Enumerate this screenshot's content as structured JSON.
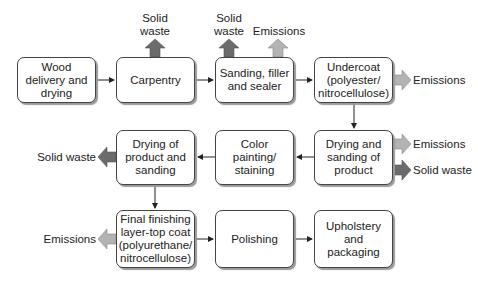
{
  "diagram": {
    "type": "process-flowchart",
    "colors": {
      "solid_waste_arrow": "#6b6b6b",
      "emissions_arrow": "#b3b3b3",
      "box_border": "#444444",
      "connector": "#222222"
    },
    "steps": [
      {
        "id": "s1",
        "label": "Wood\ndelivery and\ndrying"
      },
      {
        "id": "s2",
        "label": "Carpentry"
      },
      {
        "id": "s3",
        "label": "Sanding, filler\nand sealer"
      },
      {
        "id": "s4",
        "label": "Undercoat\n(polyester/\nnitrocellulose)"
      },
      {
        "id": "s5",
        "label": "Drying and\nsanding of\nproduct"
      },
      {
        "id": "s6",
        "label": "Color\npainting/\nstaining"
      },
      {
        "id": "s7",
        "label": "Drying of\nproduct and\nsanding"
      },
      {
        "id": "s8",
        "label": "Final finishing\nlayer-top coat\n(polyurethane/\nnitrocellulose)"
      },
      {
        "id": "s9",
        "label": "Polishing"
      },
      {
        "id": "s10",
        "label": "Upholstery and\npackaging"
      }
    ],
    "outputs": [
      {
        "from": "s2",
        "label": "Solid\nwaste",
        "kind": "solid-waste"
      },
      {
        "from": "s3",
        "label": "Solid\nwaste",
        "kind": "solid-waste"
      },
      {
        "from": "s3",
        "label": "Emissions",
        "kind": "emissions"
      },
      {
        "from": "s4",
        "label": "Emissions",
        "kind": "emissions"
      },
      {
        "from": "s5",
        "label": "Emissions",
        "kind": "emissions"
      },
      {
        "from": "s5",
        "label": "Solid waste",
        "kind": "solid-waste"
      },
      {
        "from": "s7",
        "label": "Solid waste",
        "kind": "solid-waste"
      },
      {
        "from": "s8",
        "label": "Emissions",
        "kind": "emissions"
      }
    ]
  }
}
